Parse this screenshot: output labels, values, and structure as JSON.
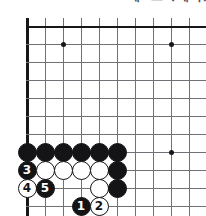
{
  "caption": {
    "text": "제8도 (계속)"
  },
  "board": {
    "type": "go-board-diagram",
    "origin": {
      "x": 27,
      "y": 26
    },
    "spacing": 18,
    "visible_cols": 10,
    "visible_rows": 11,
    "left_edge_is_board_border": true,
    "line_color": "#6f7176",
    "edge_color": "#17171a",
    "background_color": "#ffffff",
    "star_points": [
      {
        "col": 2,
        "row": 1
      },
      {
        "col": 8,
        "row": 1
      },
      {
        "col": 8,
        "row": 7
      }
    ],
    "stones": [
      {
        "col": 0,
        "row": 7,
        "color": "black",
        "label": ""
      },
      {
        "col": 1,
        "row": 7,
        "color": "black",
        "label": ""
      },
      {
        "col": 2,
        "row": 7,
        "color": "black",
        "label": ""
      },
      {
        "col": 3,
        "row": 7,
        "color": "black",
        "label": ""
      },
      {
        "col": 4,
        "row": 7,
        "color": "black",
        "label": ""
      },
      {
        "col": 5,
        "row": 7,
        "color": "black",
        "label": ""
      },
      {
        "col": 0,
        "row": 8,
        "color": "black",
        "label": "3"
      },
      {
        "col": 1,
        "row": 8,
        "color": "white",
        "label": ""
      },
      {
        "col": 2,
        "row": 8,
        "color": "white",
        "label": ""
      },
      {
        "col": 3,
        "row": 8,
        "color": "white",
        "label": ""
      },
      {
        "col": 4,
        "row": 8,
        "color": "white",
        "label": ""
      },
      {
        "col": 5,
        "row": 8,
        "color": "black",
        "label": ""
      },
      {
        "col": 0,
        "row": 9,
        "color": "white",
        "label": "4"
      },
      {
        "col": 1,
        "row": 9,
        "color": "black",
        "label": "5"
      },
      {
        "col": 4,
        "row": 9,
        "color": "white",
        "label": ""
      },
      {
        "col": 5,
        "row": 9,
        "color": "black",
        "label": ""
      },
      {
        "col": 3,
        "row": 10,
        "color": "black",
        "label": "1"
      },
      {
        "col": 4,
        "row": 10,
        "color": "white",
        "label": "2"
      }
    ]
  }
}
